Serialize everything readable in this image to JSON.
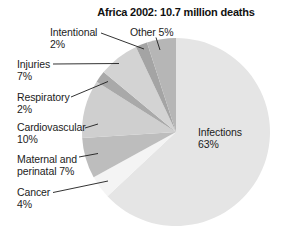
{
  "title": "Africa 2002: 10.7 million deaths",
  "chart_data": {
    "type": "pie",
    "title": "Africa 2002: 10.7 million deaths",
    "unit": "%",
    "total": "10.7 million deaths",
    "direction": "clockwise",
    "start_angle": "12 o'clock",
    "leader_line_color": "#1c1c1c",
    "background_color": "#ffffff",
    "slices": [
      {
        "label": "Infections",
        "value": 63,
        "display": [
          "Infections",
          "63%"
        ],
        "color": "#e5e5e5"
      },
      {
        "label": "Cancer",
        "value": 4,
        "display": [
          "Cancer",
          "4%"
        ],
        "color": "#f4f4f4"
      },
      {
        "label": "Maternal and perinatal",
        "value": 7,
        "display": [
          "Maternal and",
          "perinatal 7%"
        ],
        "color": "#bdbdbd"
      },
      {
        "label": "Cardiovascular",
        "value": 10,
        "display": [
          "Cardiovascular",
          "10%"
        ],
        "color": "#cfcfcf"
      },
      {
        "label": "Respiratory",
        "value": 2,
        "display": [
          "Respiratory",
          "2%"
        ],
        "color": "#a9a9a9"
      },
      {
        "label": "Injuries",
        "value": 7,
        "display": [
          "Injuries",
          "7%"
        ],
        "color": "#d3d3d3"
      },
      {
        "label": "Intentional",
        "value": 2,
        "display": [
          "Intentional",
          "2%"
        ],
        "color": "#a4a4a4"
      },
      {
        "label": "Other",
        "value": 5,
        "display": [
          "Other 5%"
        ],
        "color": "#b6b6b6"
      }
    ]
  }
}
